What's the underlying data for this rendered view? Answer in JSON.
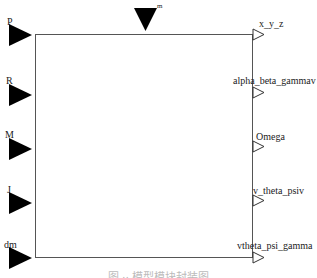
{
  "block": {
    "top_input": {
      "label": "m"
    },
    "inputs": [
      {
        "label": "P"
      },
      {
        "label": "R"
      },
      {
        "label": "M"
      },
      {
        "label": "J"
      },
      {
        "label": "dm"
      }
    ],
    "outputs": [
      {
        "label": "x_y_z"
      },
      {
        "label": "alpha_beta_gammav"
      },
      {
        "label": "Omega"
      },
      {
        "label": "v_theta_psiv"
      },
      {
        "label": "vtheta_psi_gamma"
      }
    ]
  },
  "caption": "图 ·· 模型模块封装图"
}
